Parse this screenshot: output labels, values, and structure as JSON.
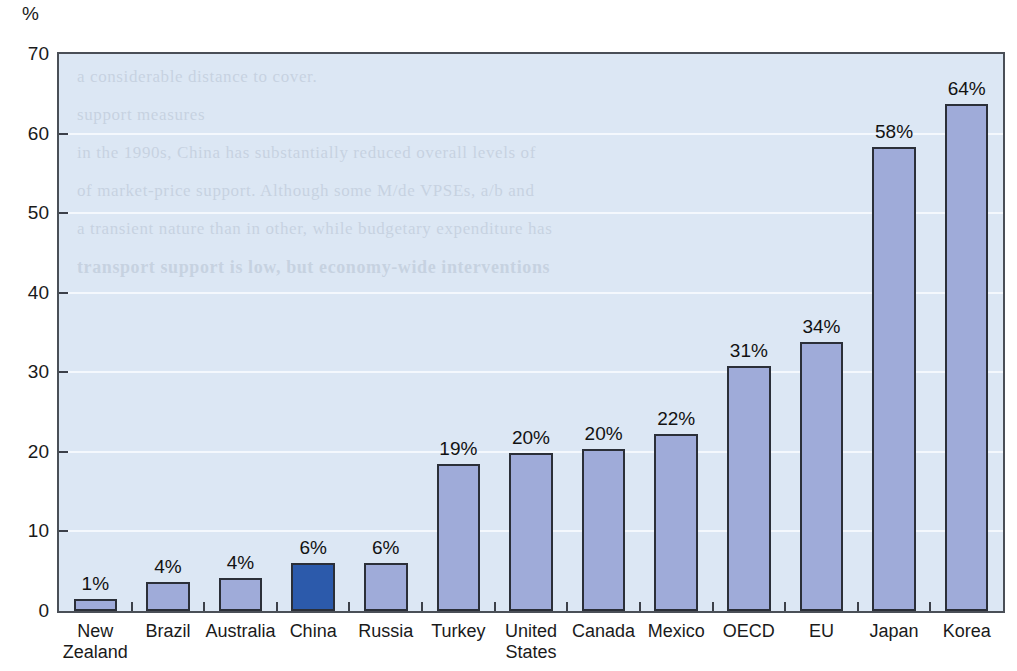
{
  "chart_data": {
    "type": "bar",
    "title": "",
    "subtitle": "",
    "xlabel": "",
    "ylabel": "%",
    "unit_label": "%",
    "ylim": [
      0,
      70
    ],
    "yticks": [
      0,
      10,
      20,
      30,
      40,
      50,
      60,
      70
    ],
    "ytick_labels": [
      "0",
      "10",
      "20",
      "30",
      "40",
      "50",
      "60",
      "70"
    ],
    "grid": true,
    "legend": "none",
    "categories": [
      "New Zealand",
      "Brazil",
      "Australia",
      "China",
      "Russia",
      "Turkey",
      "United States",
      "Canada",
      "Mexico",
      "OECD",
      "EU",
      "Japan",
      "Korea"
    ],
    "category_lines": [
      [
        "New",
        "Zealand"
      ],
      [
        "Brazil"
      ],
      [
        "Australia"
      ],
      [
        "China"
      ],
      [
        "Russia"
      ],
      [
        "Turkey"
      ],
      [
        "United",
        "States"
      ],
      [
        "Canada"
      ],
      [
        "Mexico"
      ],
      [
        "OECD"
      ],
      [
        "EU"
      ],
      [
        "Japan"
      ],
      [
        "Korea"
      ]
    ],
    "values": [
      1.5,
      3.7,
      4.2,
      6.0,
      6.0,
      18.5,
      19.8,
      20.3,
      22.2,
      30.8,
      33.8,
      58.3,
      63.7
    ],
    "data_labels": [
      "1%",
      "4%",
      "4%",
      "6%",
      "6%",
      "19%",
      "20%",
      "20%",
      "22%",
      "31%",
      "34%",
      "58%",
      "64%"
    ],
    "highlight_index": 3,
    "colors": {
      "bar_fill": "#9fabd9",
      "bar_highlight_fill": "#2c5aab",
      "bar_outline": "#2b2f38",
      "plot_background": "#dce7f4",
      "plot_border": "#4a4f57",
      "gridline": "#f4f9fd",
      "text": "#1a1a1a",
      "page_background": "#ffffff"
    }
  },
  "background_bleed": {
    "lines": [
      "a considerable distance to cover.",
      "support measures",
      "in the 1990s, China has substantially reduced overall levels of",
      "of market-price support. Although some M/de VPSEs, a/b and",
      "a transient nature than in other, while budgetary expenditure has"
    ],
    "heading": "transport support is low, but economy-wide interventions"
  }
}
